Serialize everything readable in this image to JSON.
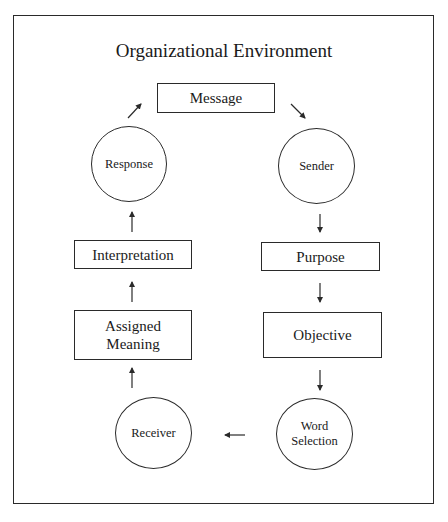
{
  "diagram": {
    "title": "Organizational Environment",
    "nodes": {
      "message": "Message",
      "sender": "Sender",
      "purpose": "Purpose",
      "objective": "Objective",
      "word_selection": "Word Selection",
      "receiver": "Receiver",
      "assigned_meaning": "Assigned Meaning",
      "interpretation": "Interpretation",
      "response": "Response"
    },
    "flow": [
      "Message",
      "Sender",
      "Purpose",
      "Objective",
      "Word Selection",
      "Receiver",
      "Assigned Meaning",
      "Interpretation",
      "Response",
      "Message"
    ],
    "colors": {
      "line": "#2a2a2a",
      "background": "#ffffff"
    }
  }
}
